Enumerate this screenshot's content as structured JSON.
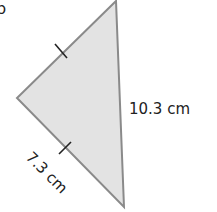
{
  "figure": {
    "marker": "b",
    "shape": "isosceles triangle",
    "fill_color": "#e3e3e3",
    "stroke_color": "#8a8a8a",
    "vertices": {
      "top": [
        116,
        1
      ],
      "left": [
        17,
        98
      ],
      "bottom": [
        124,
        207
      ]
    },
    "labels": {
      "right_side": "10.3 cm",
      "lower_left_side": "7.3 cm"
    },
    "tick_marks": "equal-length marks on the two left sides"
  }
}
